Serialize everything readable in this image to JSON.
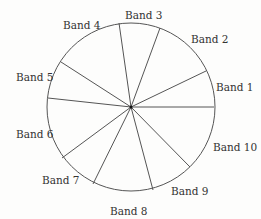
{
  "diagram": {
    "center": [
      131,
      107
    ],
    "radius": 84,
    "stroke_color": "#555555",
    "spokes": [
      [
        214,
        107
      ],
      [
        206,
        71
      ],
      [
        160,
        28
      ],
      [
        119,
        23
      ],
      [
        61,
        62
      ],
      [
        48,
        98
      ],
      [
        62,
        158
      ],
      [
        93,
        184
      ],
      [
        153,
        190
      ],
      [
        190,
        167
      ]
    ],
    "bands": [
      {
        "label": "Band 1",
        "x": 216,
        "y": 91
      },
      {
        "label": "Band 2",
        "x": 191,
        "y": 43
      },
      {
        "label": "Band 3",
        "x": 125,
        "y": 19
      },
      {
        "label": "Band 4",
        "x": 63,
        "y": 29
      },
      {
        "label": "Band 5",
        "x": 16,
        "y": 81
      },
      {
        "label": "Band 6",
        "x": 16,
        "y": 138
      },
      {
        "label": "Band 7",
        "x": 42,
        "y": 184
      },
      {
        "label": "Band 8",
        "x": 110,
        "y": 215
      },
      {
        "label": "Band 9",
        "x": 171,
        "y": 195
      },
      {
        "label": "Band 10",
        "x": 213,
        "y": 151
      }
    ]
  }
}
